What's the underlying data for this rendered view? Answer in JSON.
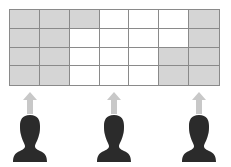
{
  "diagram": {
    "grid": {
      "rows": 4,
      "cols": 7,
      "shaded_color": "#d5d5d5",
      "empty_color": "#ffffff",
      "line_color": "#8a8a8a",
      "cells": [
        [
          "shaded",
          "shaded",
          "shaded",
          "empty",
          "empty",
          "empty",
          "shaded"
        ],
        [
          "shaded",
          "shaded",
          "empty",
          "empty",
          "empty",
          "empty",
          "shaded"
        ],
        [
          "shaded",
          "shaded",
          "empty",
          "empty",
          "empty",
          "shaded",
          "shaded"
        ],
        [
          "shaded",
          "shaded",
          "empty",
          "empty",
          "empty",
          "shaded",
          "shaded"
        ]
      ]
    },
    "people": [
      {
        "icon": "person-silhouette-icon",
        "arrow": "arrow-up-icon",
        "center_x": 30
      },
      {
        "icon": "person-silhouette-icon",
        "arrow": "arrow-up-icon",
        "center_x": 114
      },
      {
        "icon": "person-silhouette-icon",
        "arrow": "arrow-up-icon",
        "center_x": 199
      }
    ],
    "arrow_color": "#c8c8c8",
    "person_color": "#2b2b2b"
  }
}
